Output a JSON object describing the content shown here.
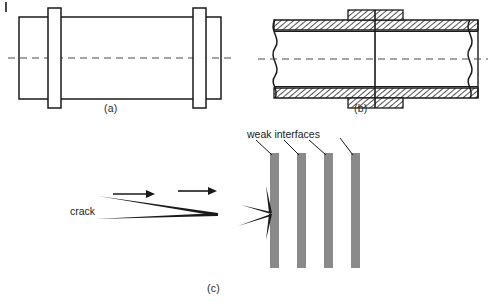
{
  "figure": {
    "background": "#ffffff",
    "ink_color": "#1a1a1a",
    "interface_color": "#8a8a8a",
    "corner_mark": "|"
  },
  "panels": [
    {
      "id": "a",
      "caption": "(a)",
      "description": "Side elevation of pipe with two flange rings and dashed axis centerline",
      "elements": {
        "body": "pipe-body-rectangle",
        "flange_left": "flange-ring-left",
        "flange_right": "flange-ring-right",
        "centerline": "dashed-axis-centerline"
      }
    },
    {
      "id": "b",
      "caption": "(b)",
      "description": "Hatched longitudinal section of pipe joint with external collar sleeve and wavy break lines",
      "elements": {
        "wall_top": "hatched-upper-wall",
        "wall_bottom": "hatched-lower-wall",
        "collar_top": "hatched-collar-upper",
        "collar_bottom": "hatched-collar-lower",
        "joint_line": "vertical-joint-line",
        "break_left": "wavy-break-line-left",
        "break_right": "wavy-break-line-right",
        "centerline": "dashed-axis-centerline"
      }
    },
    {
      "id": "c",
      "caption": "(c)",
      "description": "Crack propagating rightward, deflecting and arresting at the first of four weak interfaces",
      "labels": {
        "crack": "crack",
        "weak_interfaces": "weak interfaces"
      },
      "arrows": [
        {
          "name": "propagation-arrow-1"
        },
        {
          "name": "propagation-arrow-2"
        }
      ],
      "interface_bars": 4,
      "leader_lines": 4
    }
  ]
}
